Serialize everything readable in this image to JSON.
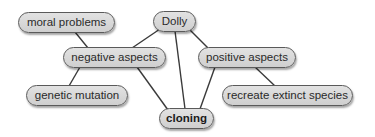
{
  "diagram": {
    "type": "concept-map",
    "colors": {
      "node_fill": "#d8d8d8",
      "node_border": "#5a5a5a",
      "edge": "#3a3a3a",
      "text": "#2a2a2a"
    },
    "nodes": [
      {
        "id": "moral",
        "label": "moral problems"
      },
      {
        "id": "dolly",
        "label": "Dolly"
      },
      {
        "id": "negative",
        "label": "negative aspects"
      },
      {
        "id": "positive",
        "label": "positive aspects"
      },
      {
        "id": "genetic",
        "label": "genetic mutation"
      },
      {
        "id": "recreate",
        "label": "recreate extinct species"
      },
      {
        "id": "cloning",
        "label": "cloning",
        "bold": true
      }
    ],
    "edges": [
      [
        "moral",
        "negative"
      ],
      [
        "dolly",
        "negative"
      ],
      [
        "dolly",
        "positive"
      ],
      [
        "dolly",
        "cloning"
      ],
      [
        "negative",
        "genetic"
      ],
      [
        "negative",
        "cloning"
      ],
      [
        "positive",
        "cloning"
      ],
      [
        "positive",
        "recreate"
      ]
    ]
  }
}
